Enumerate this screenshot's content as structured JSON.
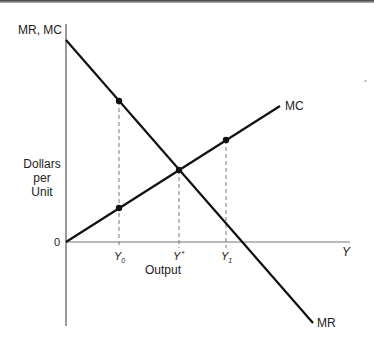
{
  "diagram": {
    "y_axis_label_top": "MR, MC",
    "y_axis_label": [
      "Dollars",
      "per",
      "Unit"
    ],
    "origin_label": "0",
    "x_axis_end_label": "Y",
    "x_axis_title": "Output",
    "curves": {
      "mr": {
        "label": "MR",
        "description": "Marginal revenue, downward sloping"
      },
      "mc": {
        "label": "MC",
        "description": "Marginal cost, upward sloping"
      }
    },
    "ticks": {
      "y0": {
        "base": "Y",
        "sub": "0"
      },
      "ystar": {
        "base": "Y",
        "sup": "*"
      },
      "y1": {
        "base": "Y",
        "sub": "1"
      }
    },
    "points": [
      {
        "name": "MR at Y0",
        "x": 119,
        "y": 101
      },
      {
        "name": "MC at Y0",
        "x": 119,
        "y": 208
      },
      {
        "name": "MR=MC at Y*",
        "x": 179,
        "y": 170
      },
      {
        "name": "MC at Y1",
        "x": 226,
        "y": 140
      }
    ],
    "colors": {
      "line": "#111111",
      "axis": "#555555",
      "dash": "#777777"
    }
  }
}
